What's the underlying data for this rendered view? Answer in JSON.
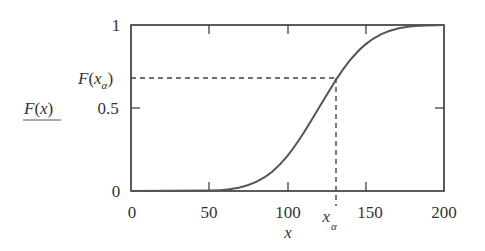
{
  "chart_data": {
    "type": "line",
    "title": "",
    "xlabel": "x",
    "ylabel": "F(x)",
    "xlim": [
      0,
      200
    ],
    "ylim": [
      0,
      1
    ],
    "x_ticks": [
      0,
      50,
      100,
      150,
      200
    ],
    "x_tick_labels": [
      "0",
      "50",
      "100",
      "150",
      "200"
    ],
    "y_ticks": [
      0,
      0.5,
      1
    ],
    "y_tick_labels": [
      "0",
      "0.5",
      "1"
    ],
    "grid": false,
    "legend": null,
    "series": [
      {
        "name": "F(x)",
        "description": "cumulative distribution function (normal-like, mean ≈ 120, sd ≈ 25)",
        "x": [
          0,
          50,
          60,
          70,
          80,
          90,
          100,
          110,
          120,
          130,
          131,
          140,
          150,
          160,
          170,
          180,
          190,
          200
        ],
        "values": [
          0.0,
          0.003,
          0.008,
          0.023,
          0.055,
          0.115,
          0.212,
          0.345,
          0.5,
          0.655,
          0.67,
          0.788,
          0.885,
          0.945,
          0.977,
          0.992,
          0.997,
          1.0
        ]
      }
    ],
    "annotations": [
      {
        "type": "hline-dashed",
        "y": 0.67,
        "x_from": 0,
        "x_to": 131,
        "label": "F(x_α)"
      },
      {
        "type": "vline-dashed",
        "x": 131,
        "y_from": 0,
        "y_to": 0.67,
        "label": "x_α"
      }
    ]
  },
  "labels": {
    "ylabel_main": "F",
    "ylabel_paren_open": "(",
    "ylabel_var": "x",
    "ylabel_paren_close": ")",
    "xlabel": "x",
    "xalpha_var": "x",
    "xalpha_sub": "α",
    "fxalpha_F": "F",
    "fxalpha_open": "(",
    "fxalpha_x": "x",
    "fxalpha_sub": "α",
    "fxalpha_close": ")"
  },
  "colors": {
    "axis": "#333333",
    "curve": "#555555",
    "dashed": "#444444"
  }
}
